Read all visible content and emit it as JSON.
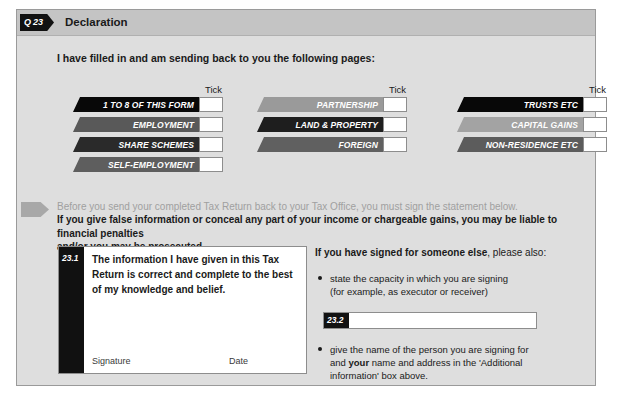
{
  "header": {
    "question_tag": "Q 23",
    "title": "Declaration"
  },
  "intro": {
    "text": "I have filled in and am sending back to you the following pages:"
  },
  "tick_columns": [
    {
      "tick_header": "Tick",
      "rows": [
        {
          "label": "1 TO 8 OF THIS FORM",
          "color": "#080808",
          "checked": false
        },
        {
          "label": "EMPLOYMENT",
          "color": "#595959",
          "checked": false
        },
        {
          "label": "SHARE SCHEMES",
          "color": "#2a2a2a",
          "checked": false
        },
        {
          "label": "SELF-EMPLOYMENT",
          "color": "#5e5e5e",
          "checked": false
        }
      ]
    },
    {
      "tick_header": "Tick",
      "rows": [
        {
          "label": "PARTNERSHIP",
          "color": "#9a9a9a",
          "checked": false
        },
        {
          "label": "LAND & PROPERTY",
          "color": "#1e1e1e",
          "checked": false
        },
        {
          "label": "FOREIGN",
          "color": "#606060",
          "checked": false
        }
      ]
    },
    {
      "tick_header": "Tick",
      "rows": [
        {
          "label": "TRUSTS ETC",
          "color": "#080808",
          "checked": false
        },
        {
          "label": "CAPITAL GAINS",
          "color": "#a3a3a3",
          "checked": false
        },
        {
          "label": "NON-RESIDENCE ETC",
          "color": "#5c5c5c",
          "checked": false
        }
      ]
    }
  ],
  "warning": {
    "light_line": "Before you send your completed Tax Return back to your Tax Office, you must sign the statement below.",
    "bold_line_1": "If you give false information or conceal any part of your income or chargeable gains, you may be liable to financial penalties",
    "bold_line_2": "and/or you may be prosecuted ."
  },
  "declaration": {
    "box_number": "23.1",
    "statement": "The information I have given in this Tax Return is correct and complete to the best of my knowledge and belief.",
    "signature_label": "Signature",
    "date_label": "Date",
    "signature_value": "",
    "date_value": ""
  },
  "right_panel": {
    "heading_bold": "If you have signed for someone else",
    "heading_rest": ", please also:",
    "bullet_1_line_1": "state the capacity in which you are signing",
    "bullet_1_line_2": "(for example, as executor or receiver)",
    "field_232": {
      "number": "23.2",
      "value": "",
      "placeholder": ""
    },
    "bullet_2_line_1": "give the name of the person you are signing for",
    "bullet_2_line_2_pre": "and ",
    "bullet_2_line_2_bold": "your",
    "bullet_2_line_2_post": " name and address in the 'Additional",
    "bullet_2_line_3": "information' box above."
  },
  "colors": {
    "page_background": "#ffffff",
    "form_background": "#dedede",
    "header_band": "#c4c4c4",
    "tab_black": "#111111",
    "field_white": "#ffffff",
    "border_gray": "#8d8d8d",
    "muted_text": "#a0a0a0"
  }
}
